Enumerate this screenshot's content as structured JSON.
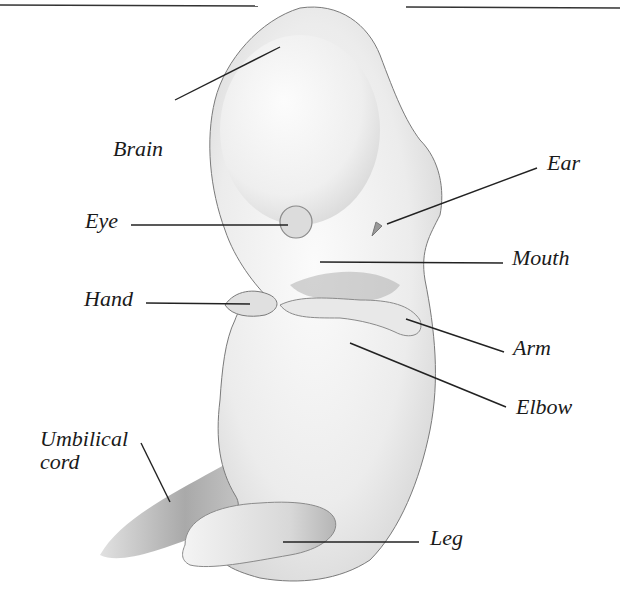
{
  "figure": {
    "labels": {
      "brain": "Brain",
      "ear": "Ear",
      "eye": "Eye",
      "mouth": "Mouth",
      "hand": "Hand",
      "arm": "Arm",
      "elbow": "Elbow",
      "umbilical_line1": "Umbilical",
      "umbilical_line2": "cord",
      "leg": "Leg"
    },
    "colors": {
      "background": "#ffffff",
      "line": "#222222",
      "skin_light": "#f2f2f2",
      "skin_shadow": "#b8b8b8",
      "outline": "#777777"
    }
  }
}
